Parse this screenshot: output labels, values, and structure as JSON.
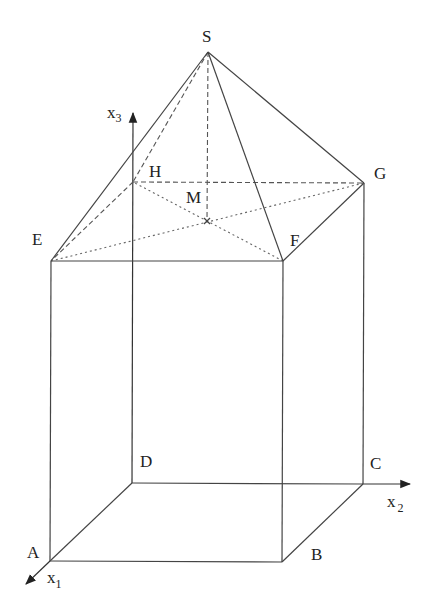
{
  "diagram": {
    "type": "3d-geometry",
    "colors": {
      "line": "#444444",
      "text": "#222222",
      "background": "#ffffff"
    },
    "points": {
      "A": {
        "label": "A",
        "x": 50,
        "y": 561
      },
      "B": {
        "label": "B",
        "x": 282,
        "y": 562
      },
      "C": {
        "label": "C",
        "x": 363,
        "y": 484
      },
      "D": {
        "label": "D",
        "x": 132,
        "y": 483
      },
      "E": {
        "label": "E",
        "x": 51,
        "y": 261
      },
      "F": {
        "label": "F",
        "x": 283,
        "y": 261
      },
      "G": {
        "label": "G",
        "x": 364,
        "y": 183
      },
      "H": {
        "label": "H",
        "x": 133,
        "y": 182
      },
      "M": {
        "label": "M",
        "x": 207,
        "y": 221
      },
      "S": {
        "label": "S",
        "x": 208,
        "y": 52
      }
    },
    "axes": {
      "x1": {
        "label": "x",
        "subscript": "1"
      },
      "x2": {
        "label": "x",
        "subscript": "2"
      },
      "x3": {
        "label": "x",
        "subscript": "3"
      }
    },
    "edges": {
      "solid": [
        "AB",
        "BC",
        "AD",
        "AE",
        "BF",
        "CG",
        "EF",
        "FG",
        "SE",
        "SF",
        "SG"
      ],
      "dashed": [
        "HE",
        "HG",
        "SH",
        "SM"
      ],
      "dotted": [
        "EG",
        "FH"
      ],
      "axis_lines": [
        "D-x3",
        "D-x2",
        "A-x1"
      ]
    }
  }
}
